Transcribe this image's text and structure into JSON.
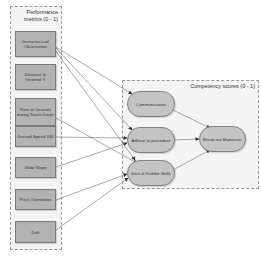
{
  "left_group": {
    "title_line1": "Performance",
    "title_line2": "metrics (0 - 1)",
    "metrics": [
      {
        "label": "Instructor-Led Observation"
      },
      {
        "label": "Distance to Inverted Y"
      },
      {
        "label": "Rate of Descent during Touch-Down"
      },
      {
        "label": "Ground Speed 180"
      },
      {
        "label": "Glide Slope"
      },
      {
        "label": "Pitch Orientation"
      },
      {
        "label": "Drift"
      }
    ]
  },
  "right_group": {
    "title": "Competency scores (0 - 1)",
    "competencies": [
      {
        "label": "Communication"
      },
      {
        "label": "Adhere to procedure"
      },
      {
        "label": "Stick & Rudder Skills"
      }
    ],
    "outcome": {
      "label": "Break-out Maneuver"
    }
  },
  "colors": {
    "box_fill": "#b3b3b3",
    "pill_fill": "#c4c4c4",
    "group_bg": "#f4f4f4",
    "edge": "#555555"
  }
}
